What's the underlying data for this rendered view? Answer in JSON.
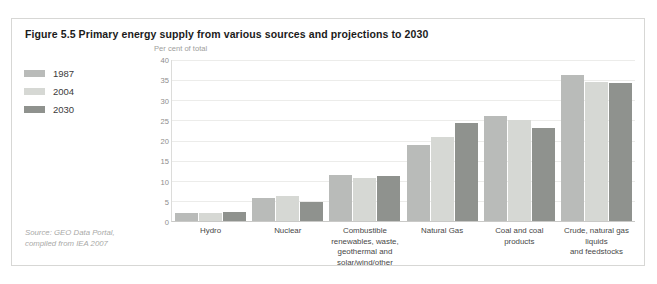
{
  "figure": {
    "title": "Figure 5.5 Primary energy supply from various sources and projections to 2030",
    "source_line1": "Source: GEO Data Portal,",
    "source_line2": "compiled from IEA 2007"
  },
  "legend": {
    "items": [
      {
        "label": "1987",
        "color": "#b9bbb9"
      },
      {
        "label": "2004",
        "color": "#d6d8d4"
      },
      {
        "label": "2030",
        "color": "#8f928e"
      }
    ]
  },
  "chart_data": {
    "type": "bar",
    "title": "Figure 5.5 Primary energy supply from various sources and projections to 2030",
    "xlabel": "",
    "ylabel": "Per cent of total",
    "ylim": [
      0,
      40
    ],
    "yticks": [
      0,
      5,
      10,
      15,
      20,
      25,
      30,
      35,
      40
    ],
    "grid": true,
    "legend_position": "left-outside",
    "categories": [
      "Hydro",
      "Nuclear",
      "Combustible renewables, waste, geothermal and solar/wind/other",
      "Natural Gas",
      "Coal and coal products",
      "Crude, natural gas liquids and feedstocks"
    ],
    "category_lines": [
      [
        "Hydro"
      ],
      [
        "Nuclear"
      ],
      [
        "Combustible renewables, waste,",
        "geothermal and solar/wind/other"
      ],
      [
        "Natural Gas"
      ],
      [
        "Coal and coal products"
      ],
      [
        "Crude, natural gas liquids",
        "and feedstocks"
      ]
    ],
    "series": [
      {
        "name": "1987",
        "color": "#b9bbb9",
        "values": [
          2.0,
          5.6,
          11.4,
          19.0,
          26.0,
          36.4
        ]
      },
      {
        "name": "2004",
        "color": "#d6d8d4",
        "values": [
          2.0,
          6.3,
          10.8,
          20.8,
          25.0,
          34.5
        ]
      },
      {
        "name": "2030",
        "color": "#8f928e",
        "values": [
          2.3,
          4.8,
          11.2,
          24.4,
          23.1,
          34.4
        ]
      }
    ]
  }
}
